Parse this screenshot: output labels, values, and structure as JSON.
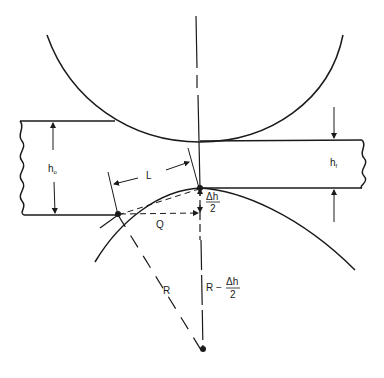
{
  "diagram": {
    "type": "rolling-mill-geometry",
    "labels": {
      "h0": "h",
      "h0_sub": "o",
      "hf": "h",
      "hf_sub": "f",
      "L": "L",
      "Q": "Q",
      "R": "R",
      "dh_num": "Δh",
      "dh_den": "2",
      "r_minus": "R −",
      "r_minus_num": "Δh",
      "r_minus_den": "2"
    },
    "colors": {
      "ink": "#1a1a1a",
      "background": "#ffffff"
    }
  }
}
